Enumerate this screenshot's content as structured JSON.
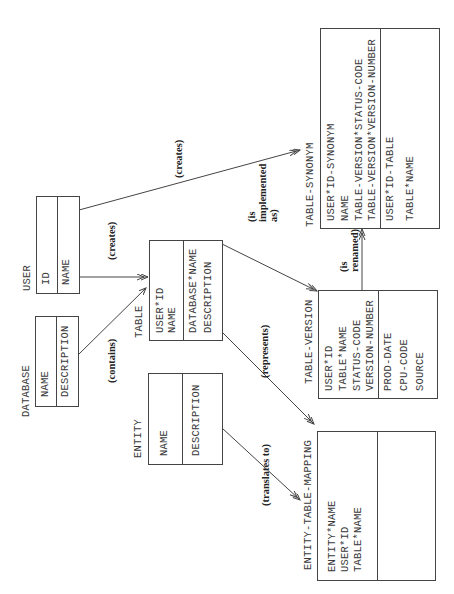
{
  "diagram": {
    "type": "entity-relationship",
    "orientation": "rotated-90-ccw",
    "entities": [
      {
        "id": "user",
        "name": "USER",
        "key_fields": [
          "ID"
        ],
        "other_fields": [
          "NAME"
        ]
      },
      {
        "id": "database",
        "name": "DATABASE",
        "key_fields": [
          "NAME"
        ],
        "other_fields": [
          "DESCRIPTION"
        ]
      },
      {
        "id": "table",
        "name": "TABLE",
        "key_fields": [
          "USER*ID",
          "NAME"
        ],
        "other_fields": [
          "DATABASE*NAME",
          "DESCRIPTION"
        ]
      },
      {
        "id": "entity",
        "name": "ENTITY",
        "key_fields": [
          "NAME"
        ],
        "other_fields": [
          "DESCRIPTION"
        ]
      },
      {
        "id": "table_synonym",
        "name": "TABLE-SYNONYM",
        "key_fields": [
          "USER*ID-SYNONYM",
          "NAME",
          "TABLE-VERSION*STATUS-CODE",
          "TABLE-VERSION*VERSION-NUMBER"
        ],
        "other_fields": [
          "USER*ID-TABLE",
          "TABLE*NAME"
        ]
      },
      {
        "id": "table_version",
        "name": "TABLE-VERSION",
        "key_fields": [
          "USER*ID",
          "TABLE*NAME",
          "STATUS-CODE",
          "VERSION-NUMBER"
        ],
        "other_fields": [
          "PROD-DATE",
          "CPU-CODE",
          "SOURCE"
        ]
      },
      {
        "id": "entity_table_mapping",
        "name": "ENTITY-TABLE-MAPPING",
        "key_fields": [
          "ENTITY*NAME",
          "USER*ID",
          "TABLE*NAME"
        ],
        "other_fields": []
      }
    ],
    "relationships": [
      {
        "from": "USER",
        "to": "TABLE-SYNONYM",
        "label": "(creates)"
      },
      {
        "from": "USER",
        "to": "TABLE",
        "label": "(creates)"
      },
      {
        "from": "DATABASE",
        "to": "TABLE",
        "label": "(contains)"
      },
      {
        "from": "TABLE",
        "to": "TABLE-VERSION",
        "label_lines": [
          "(is",
          "implemented",
          "as)"
        ]
      },
      {
        "from": "TABLE",
        "to": "ENTITY-TABLE-MAPPING",
        "label": "(represents)"
      },
      {
        "from": "TABLE-VERSION",
        "to": "TABLE-SYNONYM",
        "label_lines": [
          "(is",
          "renamed)"
        ]
      },
      {
        "from": "ENTITY",
        "to": "ENTITY-TABLE-MAPPING",
        "label": "(translates to)"
      }
    ],
    "colors": {
      "line": "#444444",
      "text": "#333333",
      "background": "#ffffff"
    }
  }
}
